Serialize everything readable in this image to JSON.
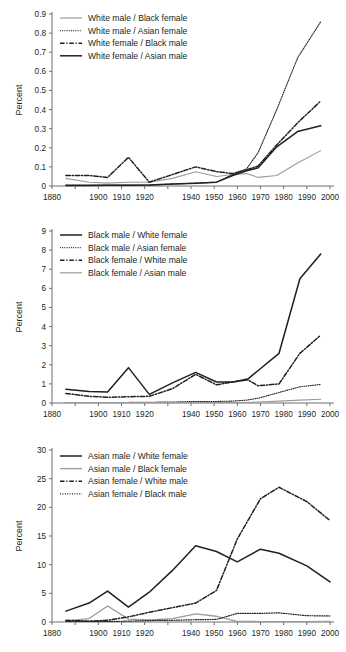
{
  "figure": {
    "panels": [
      "panel-1-white",
      "panel-2-black",
      "panel-3-asian"
    ],
    "axis_label_y": "Percent",
    "xlabel": "",
    "colors": {
      "black": "#231f20",
      "gray": "#9b9b9b"
    }
  },
  "chart_data": [
    {
      "type": "line",
      "title": "",
      "xlabel": "",
      "ylabel": "Percent",
      "xlim": [
        1880,
        2000
      ],
      "ylim": [
        0,
        0.9
      ],
      "xticks": [
        1880,
        1890,
        1900,
        1910,
        1920,
        1930,
        1940,
        1950,
        1960,
        1970,
        1980,
        1990,
        2000
      ],
      "xtick_labels": [
        "1880",
        "1900",
        "1910",
        "1920",
        "1940",
        "1950",
        "1960",
        "1970",
        "1980",
        "1990",
        "2000"
      ],
      "xticks_labeled": [
        1880,
        1900,
        1910,
        1920,
        1940,
        1950,
        1960,
        1970,
        1980,
        1990,
        2000
      ],
      "yticks": [
        0,
        0.1,
        0.2,
        0.3,
        0.4,
        0.5,
        0.6,
        0.7,
        0.8,
        0.9
      ],
      "ytick_labels": [
        "0",
        "0.1",
        "0.2",
        "0.3",
        "0.4",
        "0.5",
        "0.6",
        "0.7",
        "0.8",
        "0.9"
      ],
      "grid": false,
      "legend_position": "top-left",
      "x": [
        1886,
        1896,
        1904,
        1913,
        1922,
        1932,
        1942,
        1951,
        1958,
        1964,
        1969,
        1977,
        1986,
        1996
      ],
      "series": [
        {
          "name": "White male / Black female",
          "style": "solid",
          "color": "#9b9b9b",
          "width": 1.1,
          "values": [
            0.04,
            0.02,
            0.015,
            0.02,
            0.02,
            0.04,
            0.075,
            0.05,
            0.06,
            0.065,
            0.045,
            0.055,
            0.12,
            0.185
          ]
        },
        {
          "name": "White male / Asian female",
          "style": "dotted",
          "color": "#231f20",
          "width": 1.1,
          "values": [
            0.005,
            0.005,
            0.005,
            0.005,
            0.005,
            0.01,
            0.015,
            0.02,
            0.06,
            0.09,
            0.175,
            0.4,
            0.67,
            0.86
          ]
        },
        {
          "name": "White female / Black male",
          "style": "dashdot",
          "color": "#231f20",
          "width": 1.5,
          "values": [
            0.055,
            0.055,
            0.045,
            0.15,
            0.02,
            0.06,
            0.1,
            0.075,
            0.065,
            0.085,
            0.105,
            0.215,
            0.33,
            0.445
          ]
        },
        {
          "name": "White female / Asian male",
          "style": "solid",
          "color": "#231f20",
          "width": 1.5,
          "values": [
            0.003,
            0.003,
            0.004,
            0.004,
            0.005,
            0.01,
            0.015,
            0.02,
            0.055,
            0.08,
            0.095,
            0.205,
            0.285,
            0.315
          ]
        }
      ]
    },
    {
      "type": "line",
      "title": "",
      "xlabel": "",
      "ylabel": "Percent",
      "xlim": [
        1880,
        2000
      ],
      "ylim": [
        0,
        9
      ],
      "xticks_labeled": [
        1880,
        1900,
        1910,
        1920,
        1940,
        1950,
        1960,
        1970,
        1980,
        1990,
        2000
      ],
      "xtick_labels": [
        "1880",
        "1900",
        "1910",
        "1920",
        "1940",
        "1950",
        "1960",
        "1970",
        "1980",
        "1990",
        "2000"
      ],
      "yticks": [
        0,
        1,
        2,
        3,
        4,
        5,
        6,
        7,
        8,
        9
      ],
      "ytick_labels": [
        "0",
        "1",
        "2",
        "3",
        "4",
        "5",
        "6",
        "7",
        "8",
        "9"
      ],
      "grid": false,
      "legend_position": "top-left",
      "x": [
        1886,
        1896,
        1904,
        1913,
        1922,
        1932,
        1942,
        1951,
        1958,
        1964,
        1969,
        1978,
        1987,
        1996
      ],
      "series": [
        {
          "name": "Black male / White female",
          "style": "solid",
          "color": "#231f20",
          "width": 1.5,
          "values": [
            0.72,
            0.6,
            0.58,
            1.85,
            0.45,
            1.05,
            1.6,
            1.1,
            1.1,
            1.2,
            1.7,
            2.6,
            6.5,
            7.8
          ]
        },
        {
          "name": "Black male / Asian female",
          "style": "dotted",
          "color": "#231f20",
          "width": 1.1,
          "values": [
            0.03,
            0.03,
            0.03,
            0.03,
            0.04,
            0.05,
            0.08,
            0.08,
            0.1,
            0.15,
            0.25,
            0.55,
            0.85,
            0.97
          ]
        },
        {
          "name": "Black female / White male",
          "style": "dashdot",
          "color": "#231f20",
          "width": 1.5,
          "values": [
            0.5,
            0.35,
            0.3,
            0.33,
            0.35,
            0.75,
            1.5,
            0.95,
            1.1,
            1.25,
            0.9,
            1.0,
            2.6,
            3.55
          ]
        },
        {
          "name": "Black female / Asian male",
          "style": "solid",
          "color": "#9b9b9b",
          "width": 1.1,
          "values": [
            0.02,
            0.02,
            0.02,
            0.02,
            0.02,
            0.02,
            0.03,
            0.03,
            0.03,
            0.03,
            0.05,
            0.1,
            0.15,
            0.2
          ]
        }
      ]
    },
    {
      "type": "line",
      "title": "",
      "xlabel": "",
      "ylabel": "Percent",
      "xlim": [
        1880,
        2000
      ],
      "ylim": [
        0,
        30
      ],
      "xticks_labeled": [
        1880,
        1900,
        1910,
        1920,
        1940,
        1950,
        1960,
        1970,
        1980,
        1990,
        2000
      ],
      "xtick_labels": [
        "1880",
        "1900",
        "1910",
        "1920",
        "1940",
        "1950",
        "1960",
        "1970",
        "1980",
        "1990",
        "2000"
      ],
      "yticks": [
        0,
        5,
        10,
        15,
        20,
        25,
        30
      ],
      "ytick_labels": [
        "0",
        "5",
        "10",
        "15",
        "20",
        "25",
        "30"
      ],
      "grid": false,
      "legend_position": "top-left",
      "x": [
        1886,
        1896,
        1904,
        1913,
        1922,
        1932,
        1942,
        1951,
        1960,
        1970,
        1978,
        1990,
        2000
      ],
      "series": [
        {
          "name": "Asian male / White female",
          "style": "solid",
          "color": "#231f20",
          "width": 1.5,
          "values": [
            1.9,
            3.3,
            5.4,
            2.6,
            5.2,
            9.0,
            13.3,
            12.3,
            10.5,
            12.7,
            12.0,
            9.8,
            7.0
          ]
        },
        {
          "name": "Asian male / Black female",
          "style": "solid",
          "color": "#9b9b9b",
          "width": 1.3,
          "values": [
            0.2,
            0.6,
            2.8,
            0.5,
            0.35,
            0.6,
            1.4,
            1.0,
            0.1,
            0.08,
            0.08,
            0.08,
            0.1
          ]
        },
        {
          "name": "Asian female / White male",
          "style": "dashdot",
          "color": "#231f20",
          "width": 1.5,
          "values": [
            0.3,
            0.15,
            0.3,
            0.9,
            1.7,
            2.5,
            3.3,
            5.5,
            14.5,
            21.5,
            23.5,
            21.0,
            17.7
          ]
        },
        {
          "name": "Asian female / Black male",
          "style": "dotted",
          "color": "#231f20",
          "width": 1.2,
          "values": [
            0.1,
            0.1,
            0.1,
            0.15,
            0.25,
            0.3,
            0.4,
            0.45,
            1.5,
            1.5,
            1.6,
            1.1,
            1.05
          ]
        }
      ]
    }
  ]
}
